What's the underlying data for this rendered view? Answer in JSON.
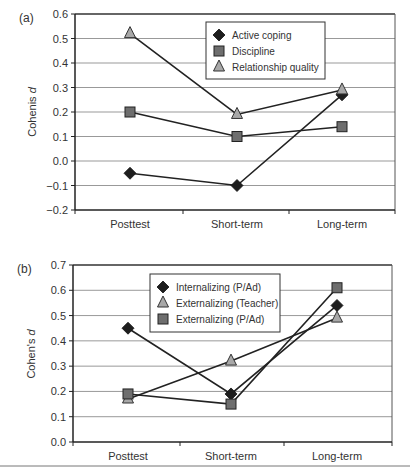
{
  "chart_data": [
    {
      "panel_label": "(a)",
      "type": "line",
      "title": "",
      "xlabel": "",
      "ylabel": "Cohenis d",
      "ylim": [
        -0.2,
        0.6
      ],
      "yticks": [
        "0.6",
        "0.5",
        "0.4",
        "0.3",
        "0.2",
        "0.1",
        "0.0",
        "−0.1",
        "−0.2"
      ],
      "grid": true,
      "legend_position": "upper-center-inside",
      "categories": [
        "Posttest",
        "Short-term",
        "Long-term"
      ],
      "series": [
        {
          "name": "Active coping",
          "marker": "diamond",
          "values": [
            -0.05,
            -0.1,
            0.27
          ]
        },
        {
          "name": "Discipline",
          "marker": "square",
          "values": [
            0.2,
            0.1,
            0.14
          ]
        },
        {
          "name": "Relationship quality",
          "marker": "triangle",
          "values": [
            0.52,
            0.19,
            0.29
          ]
        }
      ]
    },
    {
      "panel_label": "(b)",
      "type": "line",
      "title": "",
      "xlabel": "",
      "ylabel": "Cohen's d",
      "ylim": [
        0.0,
        0.7
      ],
      "yticks": [
        "0.7",
        "0.6",
        "0.5",
        "0.4",
        "0.3",
        "0.2",
        "0.1",
        "0.0"
      ],
      "grid": true,
      "legend_position": "upper-center-inside",
      "categories": [
        "Posttest",
        "Short-term",
        "Long-term"
      ],
      "series": [
        {
          "name": "Internalizing (P/Ad)",
          "marker": "diamond",
          "values": [
            0.45,
            0.19,
            0.54
          ]
        },
        {
          "name": "Externalizing (Teacher)",
          "marker": "triangle",
          "values": [
            0.17,
            0.32,
            0.49
          ]
        },
        {
          "name": "Externalizing (P/Ad)",
          "marker": "square",
          "values": [
            0.19,
            0.15,
            0.61
          ]
        }
      ]
    }
  ],
  "colors": {
    "line": "#222222",
    "diamond": "#1e1e1e",
    "square": "#6e6e6e",
    "triangle": "#a8a8a8",
    "grid": "#999999"
  }
}
